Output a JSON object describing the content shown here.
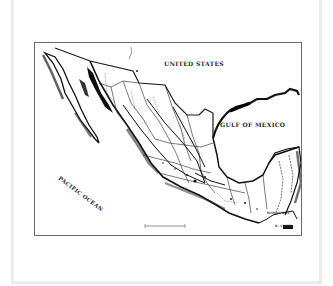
{
  "map": {
    "title": "",
    "labels": {
      "united_states": "UNITED STATES",
      "gulf_of_mexico": "GULF OF MEXICO",
      "pacific_ocean": "PACIFIC OCEAN",
      "honduras": "HONDURAS",
      "costa": "B. COSTA"
    },
    "colors": {
      "ink": "#1a1a1a",
      "border": "#6a6a6a",
      "frame": "#ececec",
      "paper": "#ffffff"
    },
    "scale_bar": {
      "visible": true
    }
  }
}
